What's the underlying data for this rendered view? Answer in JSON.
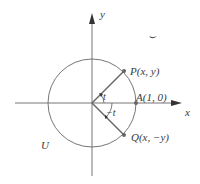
{
  "diagram": {
    "type": "unit-circle",
    "colors": {
      "line": "#555555",
      "point": "#666666",
      "text": "#3a3a3a"
    },
    "axes": {
      "x_label": "x",
      "y_label": "y"
    },
    "circle_label": "U",
    "angle_labels": {
      "positive": "t",
      "negative": "−t"
    },
    "points": [
      {
        "id": "P",
        "label": "P(x, y)"
      },
      {
        "id": "A",
        "label": "A(1, 0)"
      },
      {
        "id": "Q",
        "label": "Q(x, −y)"
      }
    ],
    "stray_mark": "⌣"
  }
}
